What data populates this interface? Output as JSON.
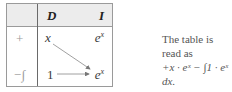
{
  "table": {
    "headers": {
      "sign": "",
      "D": "D",
      "I": "I"
    },
    "rows": [
      {
        "sign": "+",
        "D": "x",
        "I_base": "e",
        "I_exp": "x"
      },
      {
        "sign": "−∫",
        "D": "1",
        "I_base": "e",
        "I_exp": "x"
      }
    ],
    "arrows": [
      {
        "from": "row0.D",
        "to": "row1.I",
        "type": "diagonal"
      },
      {
        "from": "row1.D",
        "to": "row1.I",
        "type": "horizontal"
      }
    ]
  },
  "note": {
    "line1": "The table is read as",
    "line2": "+x · eˣ − ∫1 · eˣ dx."
  },
  "colors": {
    "header_bg": "#ececec",
    "border": "#9a9a9a",
    "text": "#3a3a3a"
  }
}
